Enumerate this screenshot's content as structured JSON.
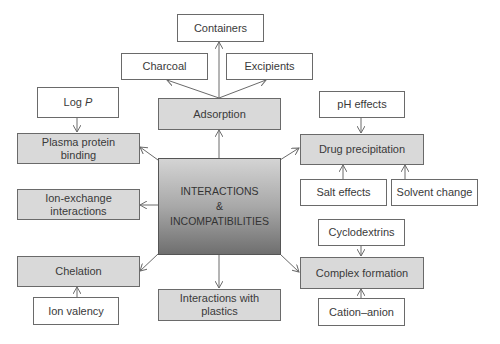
{
  "diagram": {
    "center": {
      "line1": "INTERACTIONS",
      "line2": "&",
      "line3": "INCOMPATIBILITIES"
    },
    "categories": {
      "adsorption": "Adsorption",
      "plasma_protein_binding": "Plasma protein\nbinding",
      "ion_exchange": "Ion-exchange\ninteractions",
      "chelation": "Chelation",
      "interactions_plastics": "Interactions with\nplastics",
      "drug_precipitation": "Drug precipitation",
      "complex_formation": "Complex formation"
    },
    "factors": {
      "containers": "Containers",
      "charcoal": "Charcoal",
      "excipients": "Excipients",
      "log_p_prefix": "Log ",
      "log_p_var": "P",
      "ph_effects": "pH effects",
      "salt_effects": "Salt effects",
      "solvent_change": "Solvent change",
      "ion_valency": "Ion valency",
      "cyclodextrins": "Cyclodextrins",
      "cation_anion": "Cation–anion"
    },
    "colors": {
      "category_fill": "#d9d9d9",
      "factor_fill": "#ffffff",
      "border": "#6a6a6a",
      "arrow": "#6a6a6a"
    }
  }
}
